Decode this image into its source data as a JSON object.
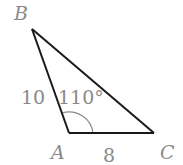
{
  "figure": {
    "type": "triangle",
    "vertices": {
      "A": {
        "label": "A",
        "x": 69,
        "y": 133
      },
      "B": {
        "label": "B",
        "x": 32,
        "y": 29
      },
      "C": {
        "label": "C",
        "x": 154,
        "y": 133
      }
    },
    "side_labels": {
      "AB": "10",
      "AC": "8"
    },
    "angle_label": "110°",
    "colors": {
      "stroke": "#1a1a1a",
      "label": "#8a8a8a",
      "arc": "#8a8a8a"
    }
  }
}
